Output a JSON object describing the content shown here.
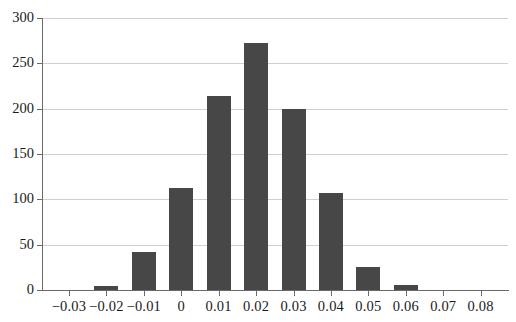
{
  "chart_data": {
    "type": "bar",
    "title": "",
    "subtitle": "",
    "xlabel": "",
    "ylabel": "",
    "categories": [
      "-0.03",
      "-0.02",
      "-0.01",
      "0",
      "0.01",
      "0.02",
      "0.03",
      "0.04",
      "0.05",
      "0.06",
      "0.07",
      "0.08"
    ],
    "x": [
      -0.03,
      -0.02,
      -0.01,
      0,
      0.01,
      0.02,
      0.03,
      0.04,
      0.05,
      0.06,
      0.07,
      0.08
    ],
    "values": [
      0,
      4,
      42,
      112,
      214,
      272,
      200,
      107,
      25,
      6,
      0,
      0
    ],
    "series": [
      {
        "name": "frequency",
        "values": [
          0,
          4,
          42,
          112,
          214,
          272,
          200,
          107,
          25,
          6,
          0,
          0
        ]
      }
    ],
    "xtick_labels": [
      "−0.03",
      "−0.02",
      "−0.01",
      "0",
      "0.01",
      "0.02",
      "0.03",
      "0.04",
      "0.05",
      "0.06",
      "0.07",
      "0.08"
    ],
    "ytick_labels": [
      "0",
      "50",
      "100",
      "150",
      "200",
      "250",
      "300"
    ],
    "yticks": [
      0,
      50,
      100,
      150,
      200,
      250,
      300
    ],
    "ylim": [
      0,
      300
    ],
    "xlim": [
      -0.035,
      0.085
    ],
    "grid": "horizontal",
    "legend": "none",
    "bar_color": "#474747",
    "gridline_color": "#d0d0d0",
    "axis_color": "#6a6a6a",
    "background_color": "#ffffff"
  }
}
